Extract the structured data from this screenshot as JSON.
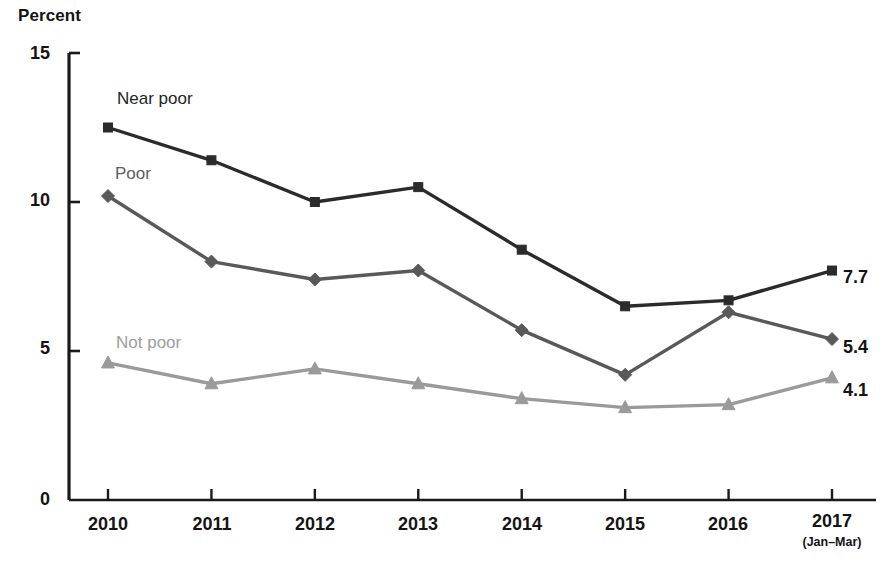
{
  "chart_data": {
    "type": "line",
    "title": "",
    "ylabel": "Percent",
    "xlabel": "",
    "ylim": [
      0,
      15
    ],
    "yticks": [
      0,
      5,
      10,
      15
    ],
    "ytick_labels": [
      "0",
      "5",
      "10",
      "15"
    ],
    "grid": false,
    "legend_position": "inline-labels",
    "categories": [
      "2010",
      "2011",
      "2012",
      "2013",
      "2014",
      "2015",
      "2016",
      "2017"
    ],
    "category_sublabels": [
      "",
      "",
      "",
      "",
      "",
      "",
      "",
      "(Jan–Mar)"
    ],
    "series": [
      {
        "name": "Near poor",
        "marker": "square",
        "color": "#2b2b2b",
        "values": [
          12.5,
          11.4,
          10.0,
          10.5,
          8.4,
          6.5,
          6.7,
          7.7
        ],
        "end_label": "7.7"
      },
      {
        "name": "Poor",
        "marker": "diamond",
        "color": "#595959",
        "values": [
          10.2,
          8.0,
          7.4,
          7.7,
          5.7,
          4.2,
          6.3,
          5.4
        ],
        "end_label": "5.4"
      },
      {
        "name": "Not poor",
        "marker": "triangle",
        "color": "#9a9a9a",
        "values": [
          4.6,
          3.9,
          4.4,
          3.9,
          3.4,
          3.1,
          3.2,
          4.1
        ],
        "end_label": "4.1"
      }
    ],
    "annotations": [
      {
        "text": "Near poor",
        "series": "Near poor"
      },
      {
        "text": "Poor",
        "series": "Poor"
      },
      {
        "text": "Not poor",
        "series": "Not poor"
      }
    ]
  },
  "axis": {
    "y_title": "Percent",
    "y_labels": [
      "15",
      "10",
      "5",
      "0"
    ],
    "x_labels": [
      "2010",
      "2011",
      "2012",
      "2013",
      "2014",
      "2015",
      "2016",
      "2017"
    ],
    "x_sublabel_2017": "(Jan–Mar)"
  },
  "labels": {
    "near_poor": "Near poor",
    "poor": "Poor",
    "not_poor": "Not poor",
    "end_near_poor": "7.7",
    "end_poor": "5.4",
    "end_not_poor": "4.1"
  },
  "colors": {
    "near_poor": "#2b2b2b",
    "poor": "#595959",
    "not_poor": "#9a9a9a",
    "axis": "#1a1a1a",
    "background": "#ffffff"
  }
}
